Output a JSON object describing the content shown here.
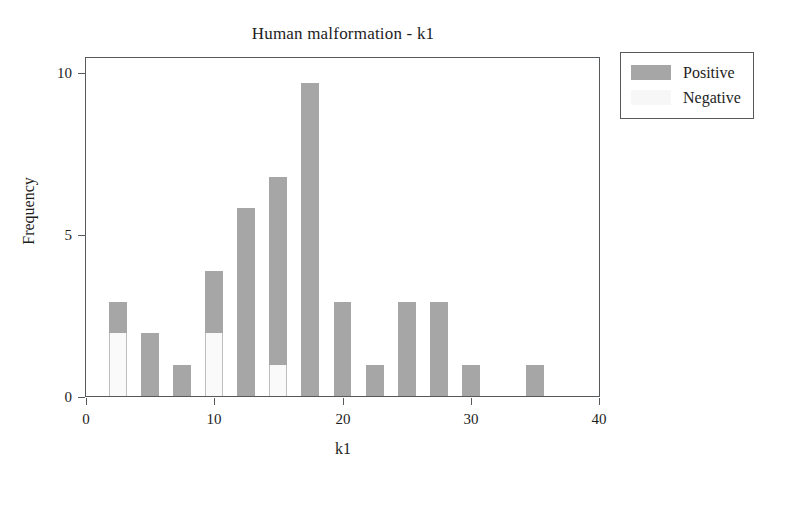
{
  "chart_data": {
    "type": "bar",
    "title": "Human malformation - k1",
    "xlabel": "k1",
    "ylabel": "Frequency",
    "xlim": [
      0,
      40
    ],
    "ylim": [
      0,
      10.8
    ],
    "xticks": [
      "0",
      "10",
      "20",
      "30",
      "40"
    ],
    "xtick_values": [
      0,
      10,
      20,
      30,
      40
    ],
    "yticks": [
      "0",
      "5",
      "10"
    ],
    "ytick_values": [
      0,
      5,
      10
    ],
    "grid": false,
    "stacked": true,
    "bar_width": 1.4,
    "legend_position": "top-right-outside",
    "categories": [
      2.5,
      5,
      7.5,
      10,
      12.5,
      15,
      17.5,
      20,
      22.5,
      25,
      27.5,
      30,
      35
    ],
    "series": [
      {
        "name": "Negative",
        "color": "#fafafa",
        "values": [
          2,
          0,
          0,
          2,
          0,
          1,
          0,
          0,
          0,
          0,
          0,
          0,
          0
        ]
      },
      {
        "name": "Positive",
        "color": "#a6a6a6",
        "values": [
          1,
          2,
          1,
          2,
          6,
          6,
          10,
          3,
          1,
          3,
          3,
          1,
          1
        ]
      }
    ],
    "totals": [
      3,
      2,
      1,
      4,
      6,
      7,
      10,
      3,
      1,
      3,
      3,
      1,
      1
    ]
  },
  "legend": {
    "items": [
      {
        "label": "Positive",
        "swatch": "positive-swatch"
      },
      {
        "label": "Negative",
        "swatch": "negative-swatch"
      }
    ]
  }
}
